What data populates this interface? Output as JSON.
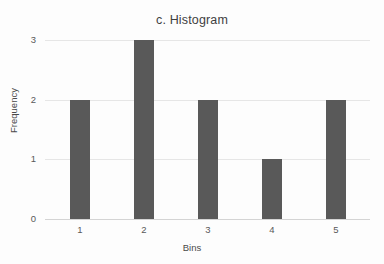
{
  "chart_data": {
    "type": "bar",
    "title": "c. Histogram",
    "xlabel": "Bins",
    "ylabel": "Frequency",
    "categories": [
      "1",
      "2",
      "3",
      "4",
      "5"
    ],
    "values": [
      2,
      3,
      2,
      1,
      2
    ],
    "ylim": [
      0,
      3
    ],
    "yticks": [
      "0",
      "1",
      "2",
      "3"
    ],
    "ytick_values": [
      0,
      1,
      2,
      3
    ],
    "grid": "horizontal",
    "legend": "none",
    "bar_color": "#595959",
    "gridline_color": "#e6e6e6",
    "background_color": "#fdfdfd",
    "text_color": "#595959"
  }
}
